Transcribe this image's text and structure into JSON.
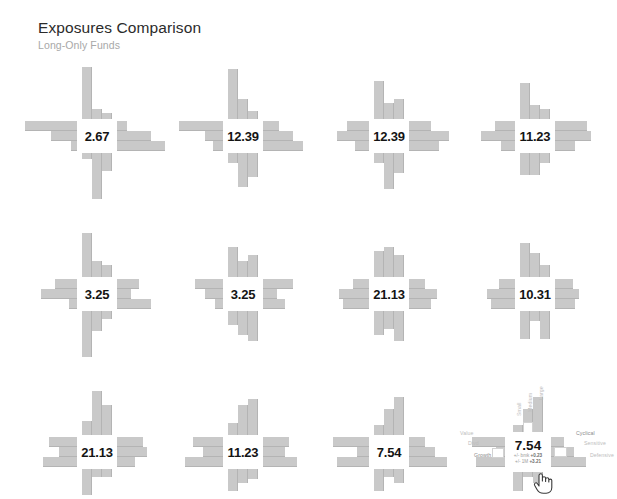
{
  "header": {
    "title": "Exposures Comparison",
    "subtitle": "Long-Only Funds"
  },
  "colors": {
    "bar": "#c9c9c9",
    "bar_edge": "#b4b4b4",
    "value_text": "#141414",
    "title_text": "#2b2b2b",
    "subtitle_text": "#a8a8a8",
    "axis_label": "#bdbdbd",
    "background": "#ffffff"
  },
  "detail": {
    "value": "7.54",
    "delta_bmk_label": "+/- bmk",
    "delta_bmk_value": "+0.23",
    "delta_1m_label": "+/- 1M",
    "delta_1m_value": "+3.21",
    "axis_labels": {
      "left_top": "Value",
      "left_mid": "Divd",
      "left_bottom": "Growth",
      "right_top": "Cyclical",
      "right_mid": "Sensitive",
      "right_bottom": "Defensive",
      "top_left": "Small",
      "top_mid": "Medium",
      "top_right": "Large"
    },
    "cursor": "hand-pointer-cursor"
  },
  "chart_data": {
    "type": "bar",
    "title": "Exposures Comparison",
    "subtitle": "Long-Only Funds",
    "xlabel": "",
    "ylabel": "",
    "grid": false,
    "legend": false,
    "arm_directions": [
      "up",
      "right",
      "down",
      "left"
    ],
    "arm_categories": {
      "up": [
        "Small",
        "Medium",
        "Large"
      ],
      "right": [
        "Cyclical",
        "Sensitive",
        "Defensive"
      ],
      "down": [
        "Small",
        "Medium",
        "Large"
      ],
      "left": [
        "Value",
        "Divd",
        "Growth"
      ]
    },
    "categories": [
      "2.67",
      "12.39",
      "12.39",
      "11.23",
      "3.25",
      "3.25",
      "21.13",
      "10.31",
      "21.13",
      "11.23",
      "7.54",
      "7.54"
    ],
    "values": [
      2.67,
      12.39,
      12.39,
      11.23,
      3.25,
      3.25,
      21.13,
      10.31,
      21.13,
      11.23,
      7.54,
      7.54
    ],
    "series": [
      {
        "name": "panel-1",
        "center": "2.67",
        "up": [
          52,
          10,
          6
        ],
        "right": [
          10,
          34,
          48
        ],
        "down": [
          6,
          46,
          18
        ],
        "left": [
          52,
          26,
          6
        ]
      },
      {
        "name": "panel-2",
        "center": "12.39",
        "up": [
          50,
          20,
          8
        ],
        "right": [
          16,
          30,
          40
        ],
        "down": [
          10,
          34,
          24
        ],
        "left": [
          44,
          18,
          10
        ]
      },
      {
        "name": "panel-3",
        "center": "12.39",
        "up": [
          38,
          16,
          20
        ],
        "right": [
          22,
          40,
          30
        ],
        "down": [
          10,
          36,
          20
        ],
        "left": [
          22,
          32,
          14
        ]
      },
      {
        "name": "panel-4",
        "center": "11.23",
        "up": [
          36,
          14,
          10
        ],
        "right": [
          32,
          36,
          20
        ],
        "down": [
          22,
          22,
          10
        ],
        "left": [
          20,
          34,
          14
        ]
      },
      {
        "name": "panel-5",
        "center": "3.25",
        "up": [
          44,
          16,
          12
        ],
        "right": [
          22,
          14,
          34
        ],
        "down": [
          46,
          20,
          8
        ],
        "left": [
          22,
          36,
          8
        ]
      },
      {
        "name": "panel-6",
        "center": "3.25",
        "up": [
          30,
          16,
          22
        ],
        "right": [
          30,
          14,
          22
        ],
        "down": [
          14,
          24,
          30
        ],
        "left": [
          28,
          18,
          8
        ]
      },
      {
        "name": "panel-7",
        "center": "21.13",
        "up": [
          26,
          30,
          22
        ],
        "right": [
          16,
          28,
          22
        ],
        "down": [
          24,
          18,
          30
        ],
        "left": [
          16,
          30,
          26
        ]
      },
      {
        "name": "panel-8",
        "center": "10.31",
        "up": [
          34,
          24,
          12
        ],
        "right": [
          18,
          24,
          20
        ],
        "down": [
          28,
          10,
          28
        ],
        "left": [
          16,
          28,
          24
        ]
      },
      {
        "name": "panel-9",
        "center": "21.13",
        "up": [
          14,
          44,
          30
        ],
        "right": [
          26,
          30,
          18
        ],
        "down": [
          26,
          8,
          8
        ],
        "left": [
          28,
          18,
          34
        ]
      },
      {
        "name": "panel-10",
        "center": "11.23",
        "up": [
          12,
          30,
          36
        ],
        "right": [
          26,
          22,
          34
        ],
        "down": [
          22,
          14,
          10
        ],
        "left": [
          30,
          20,
          38
        ]
      },
      {
        "name": "panel-11",
        "center": "7.54",
        "up": [
          10,
          26,
          38
        ],
        "right": [
          16,
          26,
          38
        ],
        "down": [
          22,
          8,
          14
        ],
        "left": [
          36,
          12,
          32
        ]
      },
      {
        "name": "panel-12-detail",
        "center": "7.54",
        "up": [
          10,
          26,
          38
        ],
        "right": [
          16,
          26,
          38
        ],
        "down": [
          22,
          8,
          14
        ],
        "left": [
          36,
          12,
          32
        ]
      }
    ],
    "panel_positions": [
      {
        "row": 1,
        "col": 1
      },
      {
        "row": 1,
        "col": 2
      },
      {
        "row": 1,
        "col": 3
      },
      {
        "row": 1,
        "col": 4
      },
      {
        "row": 2,
        "col": 1
      },
      {
        "row": 2,
        "col": 2
      },
      {
        "row": 2,
        "col": 3
      },
      {
        "row": 2,
        "col": 4
      },
      {
        "row": 3,
        "col": 1
      },
      {
        "row": 3,
        "col": 2
      },
      {
        "row": 3,
        "col": 3
      },
      {
        "row": 3,
        "col": 4
      }
    ]
  }
}
